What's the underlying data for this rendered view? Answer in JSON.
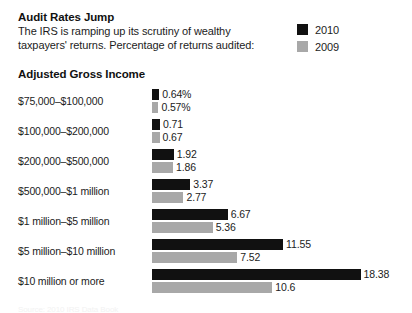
{
  "header": {
    "title": "Audit Rates Jump",
    "subtitle_line1": "The IRS is ramping up its scrutiny of wealthy",
    "subtitle_line2": "taxpayers' returns. Percentage of returns audited:"
  },
  "legend": {
    "items": [
      {
        "label": "2010",
        "color": "#111111"
      },
      {
        "label": "2009",
        "color": "#a8a8a8"
      }
    ]
  },
  "axis_heading": "Adjusted Gross Income",
  "source": "Source: 2010 IRS Data Book",
  "colors": {
    "series_2010": "#111111",
    "series_2009": "#a8a8a8",
    "text": "#1c1c1c",
    "background": "#ffffff"
  },
  "chart_data": {
    "type": "bar",
    "orientation": "horizontal",
    "title": "Audit Rates Jump",
    "subtitle": "The IRS is ramping up its scrutiny of wealthy taxpayers' returns. Percentage of returns audited:",
    "xlabel": "",
    "ylabel": "Adjusted Gross Income",
    "xlim": [
      0,
      18.38
    ],
    "grid": false,
    "legend_position": "top-right",
    "categories": [
      "$75,000–$100,000",
      "$100,000–$200,000",
      "$200,000–$500,000",
      "$500,000–$1 million",
      "$1 million–$5 million",
      "$5 million–$10 million",
      "$10 million or more"
    ],
    "series": [
      {
        "name": "2010",
        "color": "#111111",
        "values": [
          0.64,
          0.71,
          1.92,
          3.37,
          6.67,
          11.55,
          18.38
        ],
        "labels": [
          "0.64%",
          "0.71",
          "1.92",
          "3.37",
          "6.67",
          "11.55",
          "18.38"
        ]
      },
      {
        "name": "2009",
        "color": "#a8a8a8",
        "values": [
          0.57,
          0.67,
          1.86,
          2.77,
          5.36,
          7.52,
          10.6
        ],
        "labels": [
          "0.57%",
          "0.67",
          "1.86",
          "2.77",
          "5.36",
          "7.52",
          "10.6"
        ]
      }
    ]
  }
}
